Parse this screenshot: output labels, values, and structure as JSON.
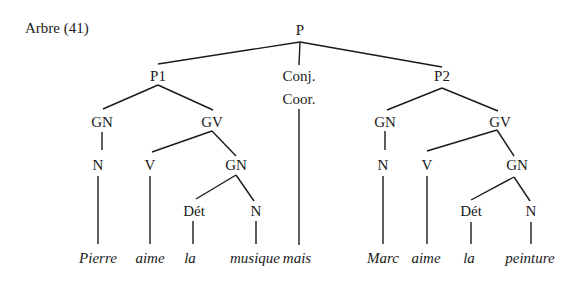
{
  "caption": "Arbre (41)",
  "nodes": {
    "P": {
      "label": "P",
      "x": 300,
      "y": 35
    },
    "P1": {
      "label": "P1",
      "x": 158,
      "y": 81
    },
    "CONJ1": {
      "label": "Conj.",
      "x": 299,
      "y": 81
    },
    "CONJ2": {
      "label": "Coor.",
      "x": 299,
      "y": 104
    },
    "P2": {
      "label": "P2",
      "x": 442,
      "y": 81
    },
    "GN1": {
      "label": "GN",
      "x": 102,
      "y": 127
    },
    "GV1": {
      "label": "GV",
      "x": 212,
      "y": 127
    },
    "N1": {
      "label": "N",
      "x": 98,
      "y": 170
    },
    "V1": {
      "label": "V",
      "x": 150,
      "y": 170
    },
    "GN2": {
      "label": "GN",
      "x": 236,
      "y": 170
    },
    "DET1": {
      "label": "Dét",
      "x": 194,
      "y": 216
    },
    "N2": {
      "label": "N",
      "x": 256,
      "y": 216
    },
    "GN3": {
      "label": "GN",
      "x": 385,
      "y": 127
    },
    "GV2": {
      "label": "GV",
      "x": 500,
      "y": 127
    },
    "N3": {
      "label": "N",
      "x": 383,
      "y": 170
    },
    "V2": {
      "label": "V",
      "x": 427,
      "y": 170
    },
    "GN4": {
      "label": "GN",
      "x": 517,
      "y": 170
    },
    "DET2": {
      "label": "Dét",
      "x": 471,
      "y": 216
    },
    "N4": {
      "label": "N",
      "x": 531,
      "y": 216
    }
  },
  "words": [
    {
      "text": "Pierre",
      "x": 98,
      "y": 263
    },
    {
      "text": "aime",
      "x": 150,
      "y": 263
    },
    {
      "text": "la",
      "x": 190,
      "y": 263
    },
    {
      "text": "musique",
      "x": 255,
      "y": 263
    },
    {
      "text": "mais",
      "x": 297,
      "y": 263
    },
    {
      "text": "Marc",
      "x": 383,
      "y": 263
    },
    {
      "text": "aime",
      "x": 426,
      "y": 263
    },
    {
      "text": "la",
      "x": 469,
      "y": 263
    },
    {
      "text": "peinture",
      "x": 530,
      "y": 263
    }
  ],
  "edges": [
    [
      300,
      42,
      158,
      64
    ],
    [
      300,
      42,
      442,
      67
    ],
    [
      300,
      42,
      299,
      65
    ],
    [
      158,
      85,
      103,
      109
    ],
    [
      158,
      85,
      213,
      110
    ],
    [
      102,
      132,
      102,
      150
    ],
    [
      212,
      131,
      152,
      152
    ],
    [
      212,
      131,
      236,
      156
    ],
    [
      236,
      175,
      196,
      199
    ],
    [
      236,
      175,
      254,
      201
    ],
    [
      98,
      176,
      98,
      244
    ],
    [
      150,
      176,
      150,
      244
    ],
    [
      299,
      109,
      299,
      245
    ],
    [
      193,
      221,
      193,
      244
    ],
    [
      256,
      221,
      256,
      244
    ],
    [
      442,
      88,
      387,
      110
    ],
    [
      442,
      88,
      498,
      111
    ],
    [
      385,
      131,
      385,
      150
    ],
    [
      497,
      130,
      427,
      151
    ],
    [
      497,
      130,
      514,
      156
    ],
    [
      514,
      177,
      471,
      200
    ],
    [
      514,
      177,
      530,
      201
    ],
    [
      383,
      176,
      383,
      244
    ],
    [
      427,
      176,
      427,
      244
    ],
    [
      471,
      222,
      471,
      244
    ],
    [
      531,
      222,
      531,
      244
    ]
  ]
}
